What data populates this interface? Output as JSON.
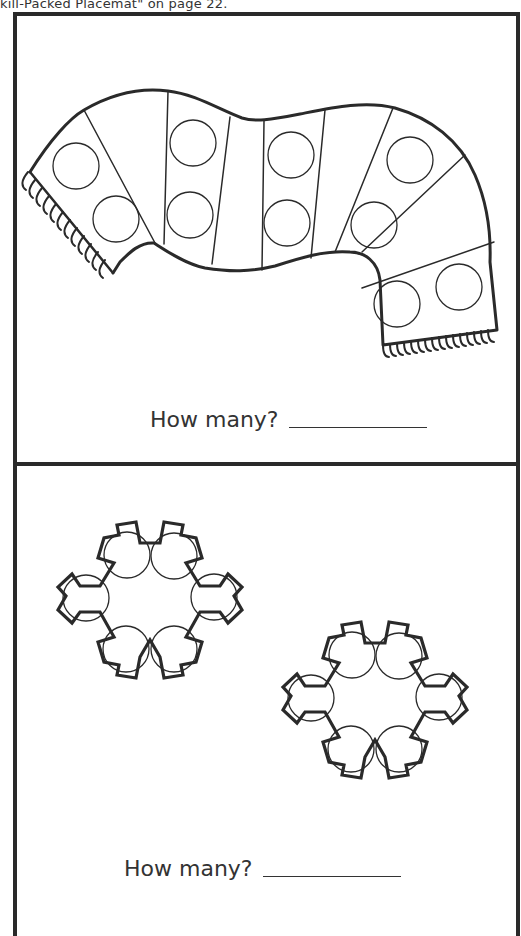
{
  "header": {
    "caption": "kill-Packed Placemat\" on page 22."
  },
  "sections": [
    {
      "name": "scarf",
      "picture": "scarf-with-circles",
      "circle_count": 10,
      "question": "How many?",
      "answer": ""
    },
    {
      "name": "snowflakes",
      "picture": "two-snowflakes-with-circles",
      "shapes": 2,
      "circles_per_shape": 6,
      "circle_count": 12,
      "question": "How many?",
      "answer": ""
    }
  ],
  "colors": {
    "ink": "#2a2a2a",
    "background": "#ffffff"
  }
}
